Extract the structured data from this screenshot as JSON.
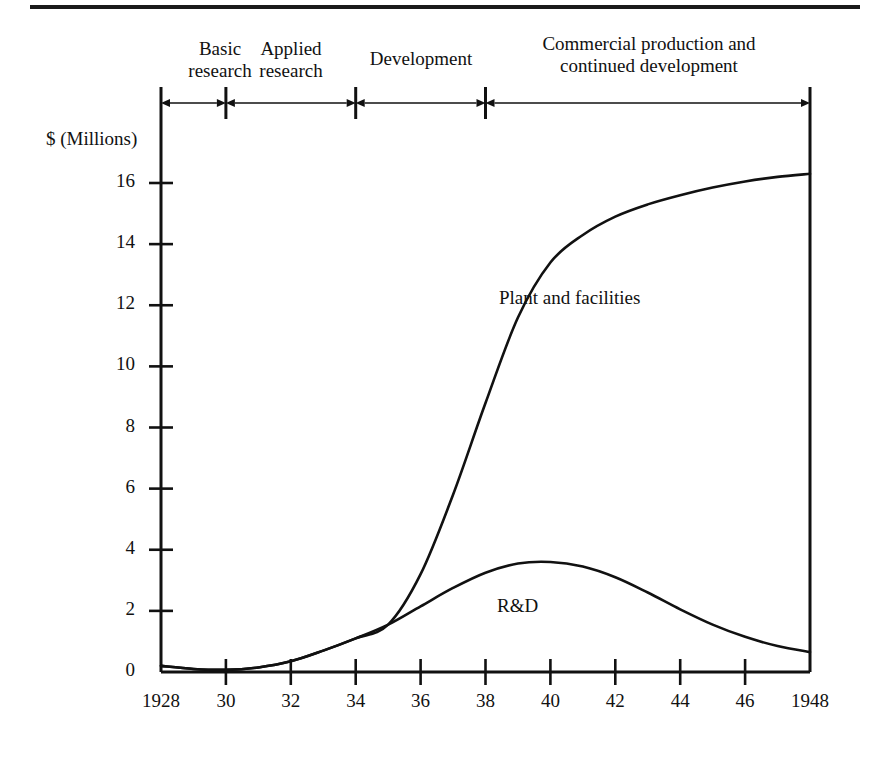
{
  "figure": {
    "top_rule": true,
    "background": "#ffffff",
    "ink_color": "#111111"
  },
  "phase_axis": {
    "name": "product-life-cycle-phases",
    "start_year": 1928,
    "end_year": 1948,
    "segments": [
      {
        "label": "Basic\nresearch",
        "from": 1928,
        "to": 1930
      },
      {
        "label": "Applied\nresearch",
        "from": 1930,
        "to": 1934
      },
      {
        "label": "Development",
        "from": 1934,
        "to": 1938
      },
      {
        "label": "Commercial production and\ncontinued development",
        "from": 1938,
        "to": 1948
      }
    ]
  },
  "chart_data": {
    "type": "line",
    "title": "",
    "xlabel": "",
    "ylabel": "$ (Millions)",
    "xlim": [
      1928,
      1948
    ],
    "ylim": [
      0,
      17
    ],
    "grid": false,
    "legend": "inline-labels",
    "x_tick_labels": [
      "1928",
      "30",
      "32",
      "34",
      "36",
      "38",
      "40",
      "42",
      "44",
      "46",
      "1948"
    ],
    "x_tick_values": [
      1928,
      1930,
      1932,
      1934,
      1936,
      1938,
      1940,
      1942,
      1944,
      1946,
      1948
    ],
    "y_tick_labels": [
      "0",
      "2",
      "4",
      "6",
      "8",
      "10",
      "12",
      "14",
      "16"
    ],
    "y_tick_values": [
      0,
      2,
      4,
      6,
      8,
      10,
      12,
      14,
      16
    ],
    "x": [
      1928,
      1929,
      1930,
      1931,
      1932,
      1933,
      1934,
      1935,
      1936,
      1937,
      1938,
      1939,
      1940,
      1941,
      1942,
      1943,
      1944,
      1945,
      1946,
      1947,
      1948
    ],
    "series": [
      {
        "name": "Plant and facilities",
        "label_x": 1939.5,
        "label_y": 12.6,
        "values": [
          0.2,
          0.1,
          0.07,
          0.15,
          0.35,
          0.7,
          1.1,
          1.55,
          3.2,
          5.8,
          8.8,
          11.6,
          13.4,
          14.3,
          14.9,
          15.3,
          15.6,
          15.85,
          16.05,
          16.2,
          16.3
        ]
      },
      {
        "name": "R&D",
        "label_x": 1939.3,
        "label_y": 2.25,
        "values": [
          0.2,
          0.1,
          0.07,
          0.15,
          0.35,
          0.7,
          1.1,
          1.55,
          2.15,
          2.75,
          3.25,
          3.55,
          3.6,
          3.45,
          3.1,
          2.6,
          2.05,
          1.55,
          1.15,
          0.85,
          0.65
        ]
      }
    ]
  }
}
